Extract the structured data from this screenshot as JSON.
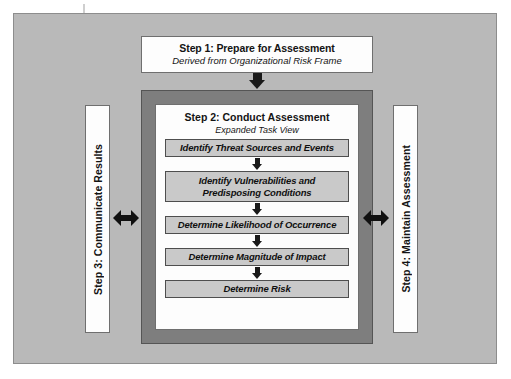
{
  "diagram": {
    "colors": {
      "canvas": "#b9b9b9",
      "frame": "#7e7e7e",
      "box_fill": "#fdfdfd",
      "task_fill": "#c9c9c9",
      "line": "#101010"
    },
    "step1": {
      "title": "Step 1: Prepare for Assessment",
      "subtitle": "Derived from Organizational Risk Frame"
    },
    "step2": {
      "title": "Step 2: Conduct Assessment",
      "subtitle": "Expanded Task View",
      "tasks": [
        {
          "lines": [
            "Identify Threat Sources and Events"
          ]
        },
        {
          "lines": [
            "Identify Vulnerabilities and",
            "Predisposing Conditions"
          ]
        },
        {
          "lines": [
            "Determine Likelihood of Occurrence"
          ]
        },
        {
          "lines": [
            "Determine Magnitude of Impact"
          ]
        },
        {
          "lines": [
            "Determine Risk"
          ]
        }
      ]
    },
    "step3": {
      "title": "Step 3: Communicate Results"
    },
    "step4": {
      "title": "Step 4: Maintain Assessment"
    }
  }
}
